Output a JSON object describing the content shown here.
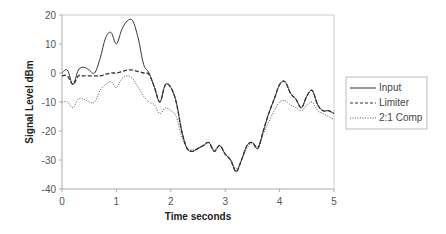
{
  "chart_data": {
    "type": "line",
    "title": "",
    "xlabel": "Time seconds",
    "ylabel": "Signal Level dBm",
    "xlim": [
      0,
      5
    ],
    "ylim": [
      -40,
      20
    ],
    "x_ticks": [
      0,
      1,
      2,
      3,
      4,
      5
    ],
    "y_ticks": [
      -40,
      -30,
      -20,
      -10,
      0,
      10,
      20
    ],
    "grid": false,
    "legend_position": "right",
    "series": [
      {
        "name": "Input",
        "style": "solid",
        "x": [
          0,
          0.1,
          0.2,
          0.3,
          0.4,
          0.5,
          0.6,
          0.7,
          0.8,
          0.9,
          1.0,
          1.1,
          1.2,
          1.3,
          1.4,
          1.5,
          1.6,
          1.7,
          1.8,
          1.9,
          2.0,
          2.1,
          2.2,
          2.3,
          2.4,
          2.5,
          2.6,
          2.7,
          2.8,
          2.9,
          3.0,
          3.1,
          3.2,
          3.3,
          3.4,
          3.5,
          3.6,
          3.7,
          3.8,
          3.9,
          4.0,
          4.1,
          4.2,
          4.3,
          4.4,
          4.5,
          4.6,
          4.7,
          4.8,
          4.9,
          5.0
        ],
        "values": [
          0,
          1,
          -4,
          1,
          2,
          1,
          0,
          5,
          12,
          14,
          10,
          15,
          18,
          18,
          12,
          3,
          0,
          -5,
          -10,
          -4,
          -5,
          -10,
          -20,
          -26,
          -27,
          -26,
          -25,
          -24,
          -27,
          -25,
          -28,
          -30,
          -34,
          -30,
          -25,
          -24,
          -26,
          -20,
          -14,
          -9,
          -4,
          -3,
          -7,
          -9,
          -12,
          -8,
          -6,
          -11,
          -13,
          -13,
          -14
        ]
      },
      {
        "name": "Limiter",
        "style": "dashed",
        "x": [
          0,
          0.1,
          0.2,
          0.3,
          0.4,
          0.5,
          0.6,
          0.7,
          0.8,
          0.9,
          1.0,
          1.1,
          1.2,
          1.3,
          1.4,
          1.5,
          1.6,
          1.7,
          1.8,
          1.9,
          2.0,
          2.1,
          2.2,
          2.3,
          2.4,
          2.5,
          2.6,
          2.7,
          2.8,
          2.9,
          3.0,
          3.1,
          3.2,
          3.3,
          3.4,
          3.5,
          3.6,
          3.7,
          3.8,
          3.9,
          4.0,
          4.1,
          4.2,
          4.3,
          4.4,
          4.5,
          4.6,
          4.7,
          4.8,
          4.9,
          5.0
        ],
        "values": [
          -1,
          -1,
          -4,
          -1,
          -1,
          -1,
          -1,
          -1,
          -0.5,
          0,
          0,
          0.5,
          1,
          1,
          0.5,
          0,
          -0.5,
          -5,
          -10,
          -4,
          -5,
          -10,
          -20,
          -26,
          -27,
          -26,
          -25,
          -24,
          -27,
          -25,
          -28,
          -30,
          -34,
          -30,
          -25,
          -24,
          -26,
          -20,
          -14,
          -9,
          -4,
          -3,
          -7,
          -9,
          -12,
          -8,
          -6,
          -11,
          -13,
          -13,
          -14
        ]
      },
      {
        "name": "2:1 Comp",
        "style": "dotted",
        "x": [
          0,
          0.1,
          0.2,
          0.3,
          0.4,
          0.5,
          0.6,
          0.7,
          0.8,
          0.9,
          1.0,
          1.1,
          1.2,
          1.3,
          1.4,
          1.5,
          1.6,
          1.7,
          1.8,
          1.9,
          2.0,
          2.1,
          2.2,
          2.3,
          2.4,
          2.5,
          2.6,
          2.7,
          2.8,
          2.9,
          3.0,
          3.1,
          3.2,
          3.3,
          3.4,
          3.5,
          3.6,
          3.7,
          3.8,
          3.9,
          4.0,
          4.1,
          4.2,
          4.3,
          4.4,
          4.5,
          4.6,
          4.7,
          4.8,
          4.9,
          5.0
        ],
        "values": [
          -10,
          -10,
          -12,
          -9,
          -9,
          -10,
          -10,
          -6,
          -4,
          -3,
          -5,
          -2,
          -1,
          -2,
          -5,
          -8,
          -10,
          -11,
          -14,
          -12,
          -13,
          -15,
          -22,
          -26,
          -26.5,
          -26,
          -25,
          -24,
          -26.5,
          -25,
          -28,
          -30,
          -33,
          -30,
          -26,
          -24,
          -25.5,
          -21,
          -17,
          -13,
          -10,
          -9.5,
          -11,
          -12,
          -13,
          -11,
          -10,
          -13,
          -14,
          -15,
          -16
        ]
      }
    ]
  },
  "legend": {
    "items": [
      {
        "label": "Input",
        "style": "solid"
      },
      {
        "label": "Limiter",
        "style": "dashed"
      },
      {
        "label": "2:1 Comp",
        "style": "dotted"
      }
    ]
  },
  "colors": {
    "line": "#333333",
    "axis": "#aaaaaa",
    "text": "#555555"
  }
}
